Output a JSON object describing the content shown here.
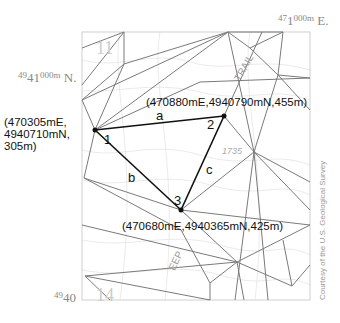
{
  "grid_labels": {
    "easting_top": {
      "prefix": "47",
      "main": "1",
      "suffix": "000m",
      "dir": "E."
    },
    "northing_top": {
      "prefix": "49",
      "main": "41",
      "suffix": "000m",
      "dir": "N."
    },
    "northing_bottom": {
      "prefix": "49",
      "main": "40"
    }
  },
  "points": [
    {
      "id": "1",
      "coords": [
        "(470305mE,",
        "4940710mN,",
        "305m)"
      ]
    },
    {
      "id": "2",
      "coords": "(470880mE,4940790mN,455m)"
    },
    {
      "id": "3",
      "coords": "(470680mE,4940365mN,425m)"
    }
  ],
  "sides": {
    "a": "a",
    "b": "b",
    "c": "c"
  },
  "map_text": {
    "trail": "TRAIL",
    "elev": "1735",
    "creek": "EEP",
    "sec11": "11",
    "sec14": "14"
  },
  "credit": "Courtesy of the U.S. Geological Survey",
  "colors": {
    "triangle": "#111111",
    "tin_edges": "#777777",
    "contours": "#d6d6d6"
  }
}
